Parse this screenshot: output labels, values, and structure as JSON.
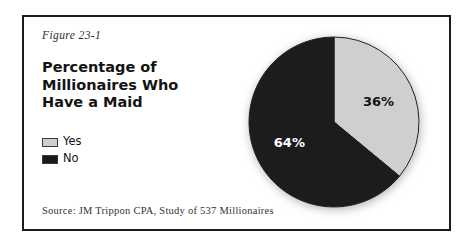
{
  "figure": {
    "label": "Figure 23-1"
  },
  "title": {
    "line1": "Percentage of",
    "line2": "Millionaires Who",
    "line3": "Have a Maid"
  },
  "legend": {
    "items": [
      {
        "label": "Yes",
        "color": "#cfcfcf"
      },
      {
        "label": "No",
        "color": "#1a1a1a"
      }
    ]
  },
  "source": {
    "text": "Source: JM Trippon CPA, Study of 537 Millionaires"
  },
  "chart_data": {
    "type": "pie",
    "title": "Percentage of Millionaires Who Have a Maid",
    "categories": [
      "Yes",
      "No"
    ],
    "values": [
      36,
      64
    ],
    "labels": [
      "36%",
      "64%"
    ],
    "colors": [
      "#cfcfcf",
      "#1a1a1a"
    ],
    "label_colors": [
      "#141414",
      "#ffffff"
    ],
    "units": "%",
    "start_angle_deg": 0,
    "direction": "clockwise",
    "legend_position": "left",
    "grid": false,
    "source": "Source: JM Trippon CPA, Study of 537 Millionaires"
  }
}
